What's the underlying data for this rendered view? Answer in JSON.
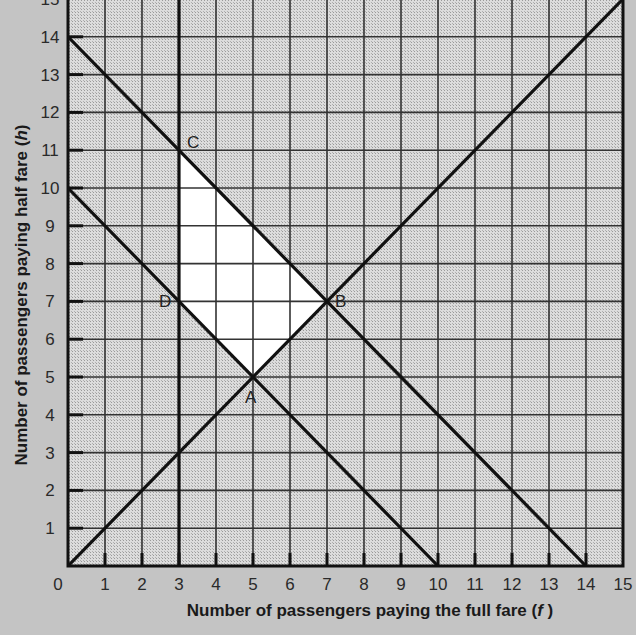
{
  "chart_data": {
    "type": "line",
    "title": "",
    "xlabel": "Number of passengers paying the full fare (f)",
    "xlabel_parts": [
      "Number of passengers paying the full fare (",
      "f",
      " )"
    ],
    "ylabel": "Number of passengers paying half fare (h)",
    "ylabel_parts": [
      "Number of passengers paying half fare (",
      "h",
      ")"
    ],
    "xlim": [
      0,
      15
    ],
    "ylim": [
      0,
      15
    ],
    "grid": true,
    "x_ticks": [
      0,
      1,
      2,
      3,
      4,
      5,
      6,
      7,
      8,
      9,
      10,
      11,
      12,
      13,
      14,
      15
    ],
    "y_ticks": [
      0,
      1,
      2,
      3,
      4,
      5,
      6,
      7,
      8,
      9,
      10,
      11,
      12,
      13,
      14,
      15
    ],
    "series": [
      {
        "name": "f = 3",
        "points": [
          [
            3,
            0
          ],
          [
            3,
            15
          ]
        ]
      },
      {
        "name": "h = f",
        "points": [
          [
            0,
            0
          ],
          [
            15,
            15
          ]
        ]
      },
      {
        "name": "f + h = 10",
        "points": [
          [
            0,
            10
          ],
          [
            10,
            0
          ]
        ]
      },
      {
        "name": "f + h = 14",
        "points": [
          [
            0,
            14
          ],
          [
            14,
            0
          ]
        ]
      }
    ],
    "feasible_region": {
      "vertices": [
        [
          5,
          5
        ],
        [
          7,
          7
        ],
        [
          3,
          11
        ],
        [
          3,
          7
        ]
      ],
      "fill": "#ffffff"
    },
    "annotations": [
      {
        "label": "A",
        "x": 5,
        "y": 5
      },
      {
        "label": "B",
        "x": 7,
        "y": 7
      },
      {
        "label": "C",
        "x": 3,
        "y": 11
      },
      {
        "label": "D",
        "x": 3,
        "y": 7
      }
    ]
  },
  "colors": {
    "page_background": "#c4c4c4",
    "plot_background": "#d6d6d6",
    "region_fill": "#ffffff",
    "line": "#111111",
    "grid": "#333333"
  }
}
